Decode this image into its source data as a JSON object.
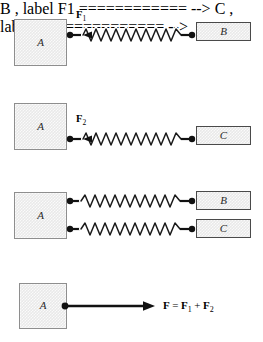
{
  "figure": {
    "caption": "",
    "colors": {
      "block_fill": "#e9e9e9",
      "block_a_border": "#8e8e8e",
      "bar_border": "#4a4a4a",
      "spring": "#1a1a1a",
      "arrow": "#111111",
      "background": "#ffffff",
      "text": "#000000"
    }
  },
  "panels": [
    {
      "id": "panel-1",
      "blocks": [
        {
          "label": "A",
          "shape": "square"
        },
        {
          "label": "B",
          "shape": "bar"
        }
      ],
      "force_label": {
        "symbol": "F",
        "subscript": "1"
      },
      "spring_coils": 11,
      "arrow_direction": "left"
    },
    {
      "id": "panel-2",
      "blocks": [
        {
          "label": "A",
          "shape": "square"
        },
        {
          "label": "C",
          "shape": "bar"
        }
      ],
      "force_label": {
        "symbol": "F",
        "subscript": "2"
      },
      "spring_coils": 11,
      "arrow_direction": "left"
    },
    {
      "id": "panel-3",
      "blocks": [
        {
          "label": "A",
          "shape": "square"
        },
        {
          "label": "B",
          "shape": "bar"
        },
        {
          "label": "C",
          "shape": "bar"
        }
      ],
      "force_label": null,
      "spring_coils": 11,
      "arrow_direction": "none"
    },
    {
      "id": "panel-4",
      "blocks": [
        {
          "label": "A",
          "shape": "square"
        }
      ],
      "equation": {
        "resultant": "F",
        "operator_equals": "=",
        "term1": "F",
        "term1_sub": "1",
        "operator_plus": "+",
        "term2": "F",
        "term2_sub": "2"
      },
      "arrow_direction": "right"
    }
  ]
}
